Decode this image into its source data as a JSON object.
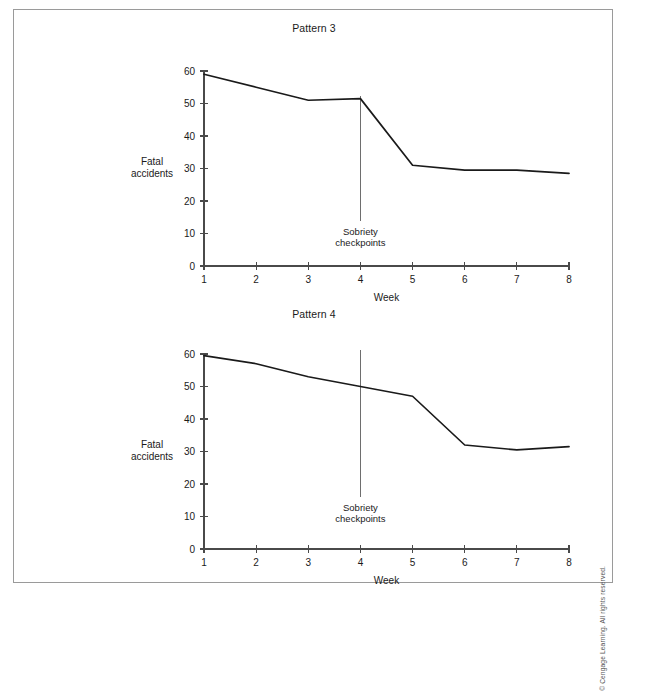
{
  "figure": {
    "copyright": "© Cengage Learning. All rights reserved."
  },
  "panels": [
    {
      "title": "Pattern 3",
      "ylabel_line1": "Fatal",
      "ylabel_line2": "accidents",
      "xlabel": "Week",
      "annotation_line1": "Sobriety",
      "annotation_line2": "checkpoints"
    },
    {
      "title": "Pattern 4",
      "ylabel_line1": "Fatal",
      "ylabel_line2": "accidents",
      "xlabel": "Week",
      "annotation_line1": "Sobriety",
      "annotation_line2": "checkpoints"
    }
  ],
  "chart_data": [
    {
      "type": "line",
      "title": "Pattern 3",
      "xlabel": "Week",
      "ylabel": "Fatal accidents",
      "x": [
        1,
        2,
        3,
        4,
        5,
        6,
        7,
        8
      ],
      "values": [
        59,
        55,
        51,
        51.5,
        31,
        29.5,
        29.5,
        28.5
      ],
      "xticklabels": [
        "1",
        "2",
        "3",
        "4",
        "5",
        "6",
        "7",
        "8"
      ],
      "yticks": [
        0,
        10,
        20,
        30,
        40,
        50,
        60
      ],
      "yticklabels": [
        "0",
        "10",
        "20",
        "30",
        "40",
        "50",
        "60"
      ],
      "xlim": [
        1,
        8
      ],
      "ylim": [
        0,
        60
      ],
      "grid": false,
      "legend": false,
      "annotations": [
        {
          "text": "Sobriety checkpoints",
          "x": 4,
          "type": "vertical-intervention-line"
        }
      ],
      "line_color": "#1a1a1a"
    },
    {
      "type": "line",
      "title": "Pattern 4",
      "xlabel": "Week",
      "ylabel": "Fatal accidents",
      "x": [
        1,
        2,
        3,
        4,
        5,
        6,
        7,
        8
      ],
      "values": [
        59.5,
        57,
        53,
        50,
        47,
        32,
        30.5,
        31.5
      ],
      "xticklabels": [
        "1",
        "2",
        "3",
        "4",
        "5",
        "6",
        "7",
        "8"
      ],
      "yticks": [
        0,
        10,
        20,
        30,
        40,
        50,
        60
      ],
      "yticklabels": [
        "0",
        "10",
        "20",
        "30",
        "40",
        "50",
        "60"
      ],
      "xlim": [
        1,
        8
      ],
      "ylim": [
        0,
        60
      ],
      "grid": false,
      "legend": false,
      "annotations": [
        {
          "text": "Sobriety checkpoints",
          "x": 4,
          "type": "vertical-intervention-line"
        }
      ],
      "line_color": "#1a1a1a"
    }
  ]
}
